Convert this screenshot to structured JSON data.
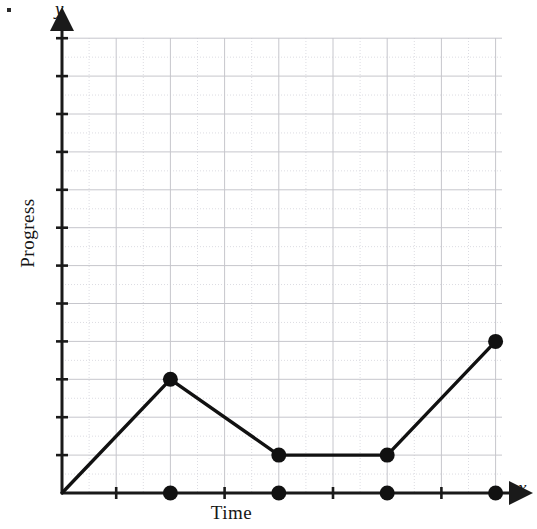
{
  "chart_data": {
    "type": "line",
    "title": "",
    "xlabel": "Time",
    "ylabel": "Progress",
    "x_axis_letter": "x",
    "y_axis_letter": "y",
    "grid": true,
    "legend": null,
    "xlim": [
      0,
      8.1
    ],
    "ylim": [
      0,
      12
    ],
    "x_major_step": 1,
    "y_major_step": 1,
    "x_tick_count": 8,
    "y_tick_count": 12,
    "tick_labels_shown": false,
    "series": [
      {
        "name": "Progress over Time",
        "x": [
          0,
          2,
          4,
          6,
          8
        ],
        "y": [
          0,
          3,
          1,
          1,
          4
        ],
        "marker": "filled-circle",
        "line_style": "solid",
        "color": "#111111"
      }
    ],
    "x_axis_markers": {
      "description": "filled dots drawn on the x-axis below each data point after the origin",
      "x": [
        2,
        4,
        6,
        8
      ],
      "y": [
        0,
        0,
        0,
        0
      ]
    },
    "annotations": [],
    "colors": {
      "line": "#111111",
      "marker": "#111111",
      "axis": "#1a1a1a",
      "major_grid": "#c6c6cc",
      "minor_grid": "#dcdce2",
      "background": "#ffffff",
      "text": "#161616"
    }
  },
  "figure": {
    "corner_mark": "bullet-dot"
  }
}
